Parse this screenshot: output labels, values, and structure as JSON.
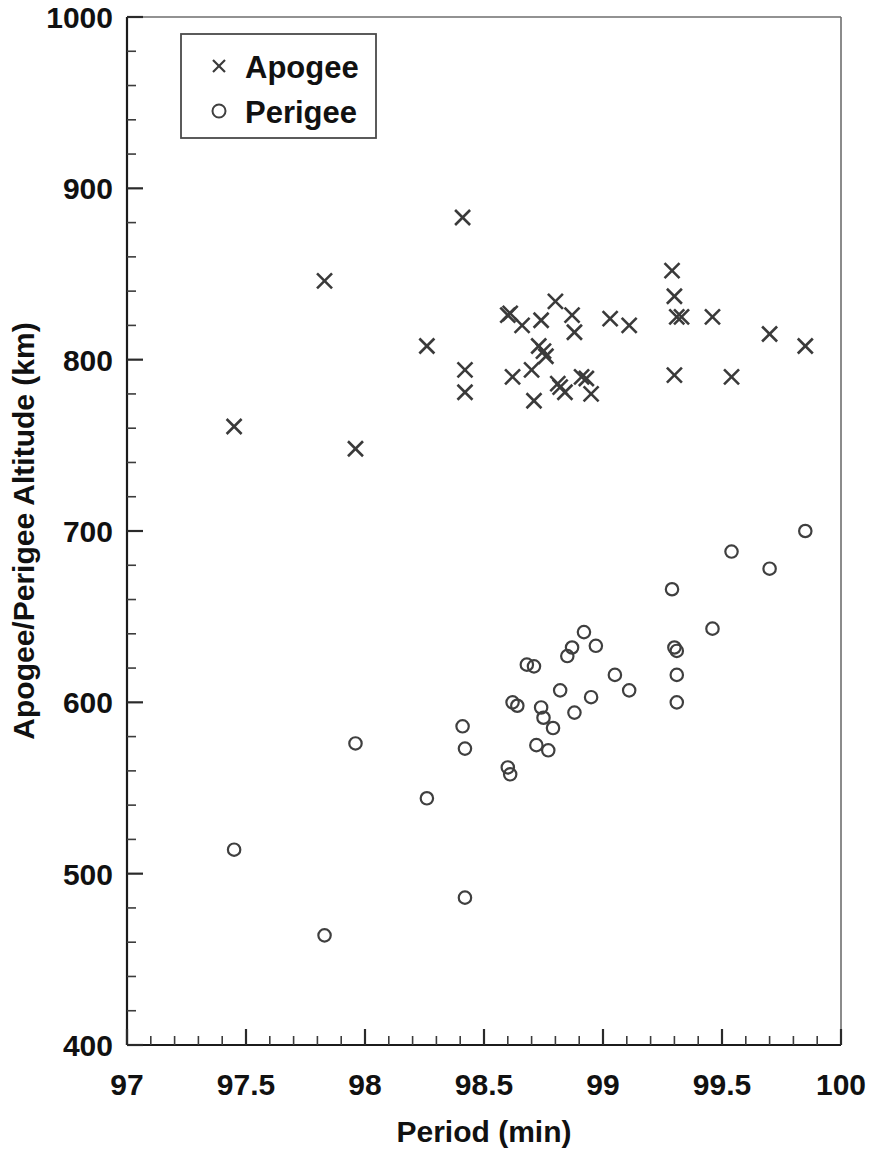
{
  "chart_data": {
    "type": "scatter",
    "title": "",
    "xlabel": "Period (min)",
    "ylabel": "Apogee/Perigee Altitude (km)",
    "xlim": [
      97,
      100
    ],
    "ylim": [
      400,
      1000
    ],
    "x_major_ticks": [
      97,
      97.5,
      98,
      98.5,
      99,
      99.5,
      100
    ],
    "x_tick_labels": [
      "97",
      "97.5",
      "98",
      "98.5",
      "99",
      "99.5",
      "100"
    ],
    "x_minor_step": 0.1,
    "y_major_ticks": [
      400,
      500,
      600,
      700,
      800,
      900,
      1000
    ],
    "y_tick_labels": [
      "400",
      "500",
      "600",
      "700",
      "800",
      "900",
      "1000"
    ],
    "y_minor_step": 20,
    "grid": false,
    "legend_position": "top-left-inside",
    "marker_color": "#3a3a3a",
    "series": [
      {
        "name": "Apogee",
        "marker": "x",
        "points": [
          [
            97.45,
            761
          ],
          [
            97.83,
            846
          ],
          [
            97.96,
            748
          ],
          [
            98.26,
            808
          ],
          [
            98.41,
            883
          ],
          [
            98.42,
            794
          ],
          [
            98.42,
            781
          ],
          [
            98.6,
            826
          ],
          [
            98.61,
            827
          ],
          [
            98.62,
            790
          ],
          [
            98.66,
            820
          ],
          [
            98.7,
            794
          ],
          [
            98.71,
            776
          ],
          [
            98.73,
            808
          ],
          [
            98.74,
            823
          ],
          [
            98.75,
            805
          ],
          [
            98.76,
            802
          ],
          [
            98.8,
            834
          ],
          [
            98.81,
            786
          ],
          [
            98.82,
            784
          ],
          [
            98.84,
            781
          ],
          [
            98.87,
            826
          ],
          [
            98.88,
            816
          ],
          [
            98.91,
            790
          ],
          [
            98.93,
            789
          ],
          [
            98.95,
            780
          ],
          [
            99.03,
            824
          ],
          [
            99.11,
            820
          ],
          [
            99.29,
            852
          ],
          [
            99.3,
            837
          ],
          [
            99.31,
            825
          ],
          [
            99.33,
            825
          ],
          [
            99.3,
            791
          ],
          [
            99.46,
            825
          ],
          [
            99.54,
            790
          ],
          [
            99.7,
            815
          ],
          [
            99.85,
            808
          ]
        ]
      },
      {
        "name": "Perigee",
        "marker": "o",
        "points": [
          [
            97.45,
            514
          ],
          [
            97.83,
            464
          ],
          [
            97.96,
            576
          ],
          [
            98.26,
            544
          ],
          [
            98.41,
            586
          ],
          [
            98.42,
            573
          ],
          [
            98.42,
            486
          ],
          [
            98.6,
            562
          ],
          [
            98.61,
            558
          ],
          [
            98.62,
            600
          ],
          [
            98.64,
            598
          ],
          [
            98.68,
            622
          ],
          [
            98.71,
            621
          ],
          [
            98.72,
            575
          ],
          [
            98.74,
            597
          ],
          [
            98.75,
            591
          ],
          [
            98.77,
            572
          ],
          [
            98.79,
            585
          ],
          [
            98.82,
            607
          ],
          [
            98.85,
            627
          ],
          [
            98.87,
            632
          ],
          [
            98.88,
            594
          ],
          [
            98.92,
            641
          ],
          [
            98.95,
            603
          ],
          [
            98.97,
            633
          ],
          [
            99.05,
            616
          ],
          [
            99.11,
            607
          ],
          [
            99.29,
            666
          ],
          [
            99.3,
            632
          ],
          [
            99.31,
            630
          ],
          [
            99.31,
            616
          ],
          [
            99.31,
            600
          ],
          [
            99.46,
            643
          ],
          [
            99.54,
            688
          ],
          [
            99.7,
            678
          ],
          [
            99.85,
            700
          ]
        ]
      }
    ]
  },
  "legend": {
    "entries": [
      {
        "label": "Apogee",
        "marker": "x"
      },
      {
        "label": "Perigee",
        "marker": "o"
      }
    ]
  },
  "axes": {
    "x_title": "Period (min)",
    "y_title": "Apogee/Perigee Altitude (km)"
  }
}
